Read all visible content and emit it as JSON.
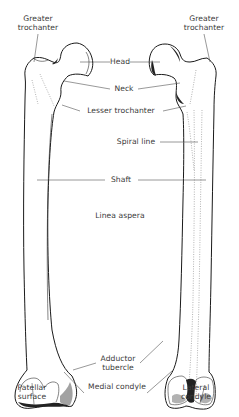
{
  "figure": {
    "views": [
      "anterior",
      "posterior"
    ],
    "labels": {
      "greater_trochanter_left": [
        "Greater",
        "trochanter"
      ],
      "greater_trochanter_right": [
        "Greater",
        "trochanter"
      ],
      "head": "Head",
      "neck": "Neck",
      "lesser_trochanter": "Lesser trochanter",
      "spiral_line": "Spiral line",
      "shaft": "Shaft",
      "linea_aspera": "Linea aspera",
      "adductor_tubercle": [
        "Adductor",
        "tubercle"
      ],
      "patellar_surface": [
        "Patellar",
        "surface"
      ],
      "medial_condyle": "Medial condyle",
      "lateral_condyle": [
        "Lateral",
        "condyle"
      ]
    },
    "colors": {
      "line": "#1a1a1a",
      "text": "#3a3a3a",
      "background": "#ffffff"
    }
  }
}
